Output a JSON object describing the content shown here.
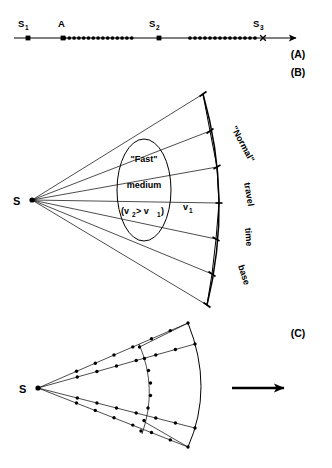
{
  "figure": {
    "panels": [
      {
        "id": "A",
        "label": "(A)"
      },
      {
        "id": "B",
        "label": "(B)"
      },
      {
        "id": "C",
        "label": "(C)"
      }
    ]
  },
  "panel_a": {
    "label": "(A)",
    "axis": {
      "x1": 14,
      "x2": 300,
      "y": 38,
      "arrow": true
    },
    "markers": [
      {
        "name": "S1",
        "base": "S",
        "sub": "1",
        "x": 28,
        "label_x": 21,
        "label_y": 26
      },
      {
        "name": "A",
        "base": "A",
        "sub": "",
        "x": 63,
        "label_x": 58,
        "label_y": 25
      },
      {
        "name": "S2",
        "base": "S",
        "sub": "2",
        "x": 159,
        "label_x": 152,
        "label_y": 26
      },
      {
        "name": "S3",
        "base": "S",
        "sub": "3",
        "x": 263,
        "label_x": 256,
        "label_y": 26
      }
    ],
    "detector_groups": [
      {
        "name": "group-1",
        "x_start": 64,
        "x_end": 131,
        "count": 15
      },
      {
        "name": "group-2",
        "x_start": 190,
        "x_end": 255,
        "count": 14
      }
    ]
  },
  "panel_b": {
    "label": "(B)",
    "source": {
      "name": "S",
      "label": "S",
      "x": 32,
      "y": 200,
      "label_x": 14,
      "label_y": 205
    },
    "ray_count": 7,
    "arc_label": "\"Normal\" travel time base",
    "arc_label_parts": [
      "\"Normal\"",
      "travel",
      "time",
      "base"
    ],
    "anomaly_region": {
      "name": "fast-medium-ellipse",
      "cx": 144,
      "cy": 190,
      "rx": 27,
      "ry": 51,
      "lines": [
        "\"Fast\"",
        "medium"
      ],
      "velocity_condition": {
        "prefix": "(v",
        "sub1": "2",
        "operator": " > v",
        "sub2": "1",
        "suffix": ")"
      }
    },
    "background_velocity": {
      "base": "v",
      "sub": "1",
      "x": 186,
      "y": 208
    }
  },
  "panel_c": {
    "label": "(C)",
    "source": {
      "name": "S",
      "label": "S",
      "x": 38,
      "y": 388,
      "label_x": 20,
      "label_y": 393
    },
    "ray_count": 4,
    "arrow": {
      "name": "direction-arrow",
      "x1": 232,
      "x2": 292,
      "y": 388
    }
  }
}
